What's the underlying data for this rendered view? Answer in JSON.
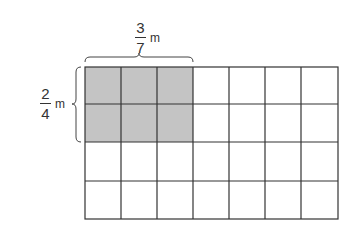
{
  "diagram": {
    "type": "fraction-area-model",
    "grid": {
      "columns": 7,
      "rows": 4,
      "shaded_columns": 3,
      "shaded_rows": 2,
      "shade_color": "#c4c4c4",
      "line_color": "#333333"
    },
    "width_label": {
      "numerator": "3",
      "denominator": "7",
      "unit": "m"
    },
    "height_label": {
      "numerator": "2",
      "denominator": "4",
      "unit": "m"
    }
  }
}
